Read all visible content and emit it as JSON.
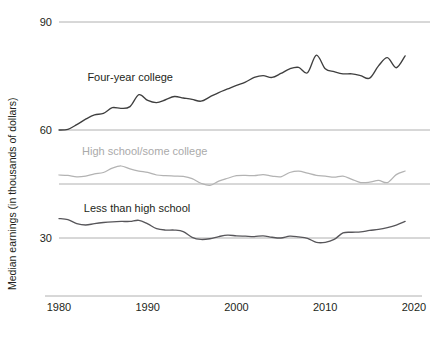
{
  "chart_data": {
    "type": "line",
    "title": "",
    "subtitle": "",
    "xlabel": "",
    "ylabel": "Median earnings (in thousands of dollars)",
    "xlim": [
      1980,
      2020
    ],
    "ylim": [
      15,
      90
    ],
    "grid": true,
    "gridlines_y": [
      90,
      60,
      45,
      30
    ],
    "xticks": [
      1980,
      1990,
      2000,
      2010,
      2020
    ],
    "xtick_labels": [
      "1980",
      "1990",
      "2000",
      "2010",
      "2020"
    ],
    "yticks": [
      90,
      60,
      30
    ],
    "ytick_labels": [
      "90",
      "60",
      "30"
    ],
    "legend_position": "inline-annotations",
    "x": [
      1980,
      1981,
      1982,
      1983,
      1984,
      1985,
      1986,
      1987,
      1988,
      1989,
      1990,
      1991,
      1992,
      1993,
      1994,
      1995,
      1996,
      1997,
      1998,
      1999,
      2000,
      2001,
      2002,
      2003,
      2004,
      2005,
      2006,
      2007,
      2008,
      2009,
      2010,
      2011,
      2012,
      2013,
      2014,
      2015,
      2016,
      2017,
      2018,
      2019
    ],
    "series": [
      {
        "name": "Four-year college",
        "color": "#3f3f3f",
        "label_color": "#231f20",
        "label_x": 1983.2,
        "label_y": 73.5,
        "values": [
          60.0,
          60.2,
          61.5,
          63.0,
          64.2,
          64.6,
          66.2,
          66.0,
          66.5,
          69.8,
          68.2,
          67.6,
          68.4,
          69.3,
          68.9,
          68.5,
          68.0,
          69.2,
          70.4,
          71.4,
          72.4,
          73.3,
          74.6,
          75.1,
          74.6,
          75.7,
          77.0,
          77.4,
          75.9,
          80.8,
          77.0,
          76.2,
          75.6,
          75.6,
          75.1,
          74.4,
          77.8,
          80.1,
          77.3,
          80.6
        ]
      },
      {
        "name": "High school/some college",
        "color": "#b3b3b3",
        "label_color": "#aaaaaa",
        "label_x": 1982.6,
        "label_y": 53.0,
        "values": [
          47.5,
          47.4,
          47.0,
          47.2,
          47.8,
          48.2,
          49.4,
          50.0,
          49.2,
          48.6,
          48.2,
          47.5,
          47.3,
          47.2,
          47.1,
          46.5,
          45.2,
          44.6,
          45.8,
          46.6,
          47.3,
          47.4,
          47.3,
          47.6,
          47.2,
          47.0,
          48.2,
          48.6,
          48.0,
          47.4,
          47.2,
          46.9,
          47.2,
          46.3,
          45.4,
          45.5,
          46.0,
          45.4,
          47.6,
          48.6
        ]
      },
      {
        "name": "Less than high school",
        "color": "#57565a",
        "label_color": "#231f20",
        "label_x": 1982.8,
        "label_y": 37.2,
        "values": [
          35.4,
          35.1,
          34.0,
          33.6,
          34.0,
          34.3,
          34.5,
          34.6,
          34.6,
          34.9,
          33.9,
          32.6,
          32.2,
          32.2,
          31.8,
          30.2,
          29.6,
          29.8,
          30.4,
          30.8,
          30.6,
          30.5,
          30.4,
          30.6,
          30.2,
          30.0,
          30.5,
          30.3,
          29.9,
          28.8,
          28.8,
          29.6,
          31.4,
          31.6,
          31.7,
          32.1,
          32.4,
          32.9,
          33.6,
          34.6
        ]
      }
    ]
  },
  "axis": {
    "y_axis_title": "Median earnings (in thousands of dollars)"
  }
}
